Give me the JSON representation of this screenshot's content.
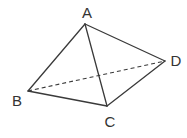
{
  "diagram": {
    "type": "tetrahedron",
    "colors": {
      "stroke": "#3a3a3a",
      "label": "#333333",
      "background": "#ffffff"
    },
    "vertices": [
      {
        "id": "A",
        "label": "A",
        "x": 85,
        "y": 24,
        "label_x": 87,
        "label_y": 12
      },
      {
        "id": "B",
        "label": "B",
        "x": 28,
        "y": 91,
        "label_x": 17,
        "label_y": 100
      },
      {
        "id": "C",
        "label": "C",
        "x": 107,
        "y": 106,
        "label_x": 110,
        "label_y": 121
      },
      {
        "id": "D",
        "label": "D",
        "x": 165,
        "y": 61,
        "label_x": 176,
        "label_y": 60
      }
    ],
    "edges": [
      {
        "from": "A",
        "to": "B",
        "style": "solid"
      },
      {
        "from": "A",
        "to": "C",
        "style": "solid"
      },
      {
        "from": "A",
        "to": "D",
        "style": "solid"
      },
      {
        "from": "B",
        "to": "C",
        "style": "solid"
      },
      {
        "from": "C",
        "to": "D",
        "style": "solid"
      },
      {
        "from": "B",
        "to": "D",
        "style": "dashed"
      }
    ]
  }
}
